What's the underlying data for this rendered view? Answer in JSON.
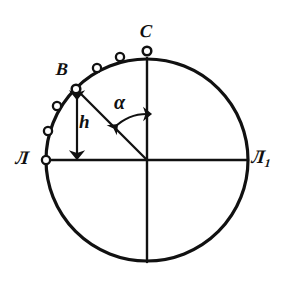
{
  "figure": {
    "kind": "geometric-diagram",
    "background_color": "#ffffff",
    "stroke_color": "#111111",
    "marker_fill_color": "#ffffff"
  },
  "geometry": {
    "center": {
      "x": 147,
      "y": 160
    },
    "radius": 101,
    "horizontal_diameter": {
      "x1": 46,
      "y1": 160,
      "x2": 248,
      "y2": 160
    },
    "vertical_diameter": {
      "x1": 147,
      "y1": 59,
      "x2": 147,
      "y2": 261
    },
    "radius_OB": {
      "x1": 147,
      "y1": 160,
      "x2": 76,
      "y2": 89
    },
    "point_B": {
      "x": 76,
      "y": 89
    },
    "point_C": {
      "x": 147,
      "y": 51
    },
    "point_A": {
      "x": 46,
      "y": 160
    },
    "height_arrow": {
      "x": 77,
      "y_top": 91,
      "y_bottom": 159
    },
    "angle_arc": {
      "radius": 46,
      "from_deg": 225,
      "to_deg": 270
    }
  },
  "arc_markers": [
    {
      "name": "marker-A",
      "x": 46,
      "y": 160
    },
    {
      "name": "marker-1",
      "x": 48,
      "y": 131
    },
    {
      "name": "marker-2",
      "x": 57,
      "y": 106
    },
    {
      "name": "marker-B",
      "x": 76,
      "y": 89
    },
    {
      "name": "marker-3",
      "x": 97,
      "y": 68
    },
    {
      "name": "marker-4",
      "x": 120,
      "y": 57
    },
    {
      "name": "marker-C",
      "x": 147,
      "y": 51
    }
  ],
  "labels": {
    "point_a": "Л",
    "point_a1_base": "Л",
    "point_a1_sub": "1",
    "point_b": "B",
    "point_c": "C",
    "angle": "α",
    "height": "h"
  }
}
